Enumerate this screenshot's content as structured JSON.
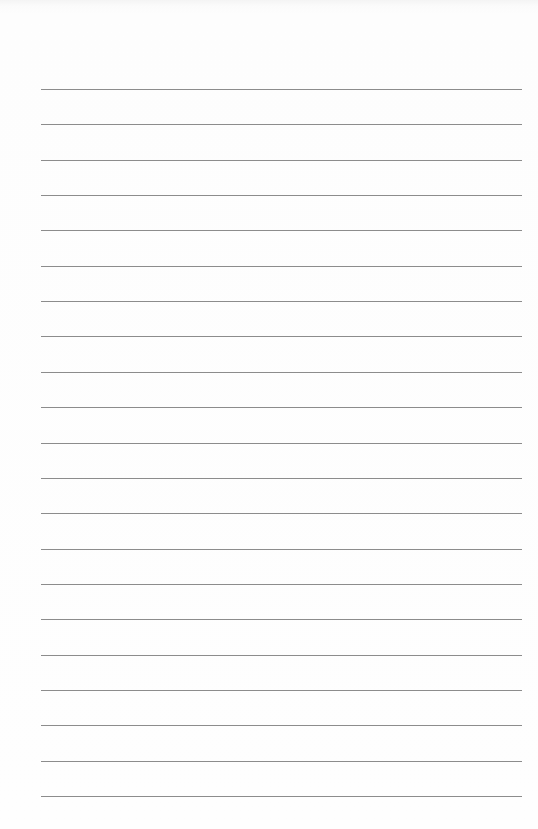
{
  "page": {
    "type": "ruled-paper",
    "background_color": "#fdfdfd",
    "line_color": "#8c8c8c",
    "line_count": 21,
    "line_left": 41,
    "line_right": 522,
    "first_line_y": 89,
    "line_spacing": 35.35,
    "text": ""
  }
}
